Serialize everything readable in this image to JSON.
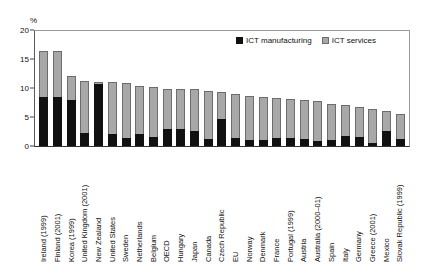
{
  "chart_data": {
    "type": "bar",
    "stacked": true,
    "title": "",
    "xlabel": "",
    "ylabel": "%",
    "ylim": [
      0,
      20
    ],
    "yticks": [
      0,
      5,
      10,
      15,
      20
    ],
    "grid": false,
    "legend_position": "top-right",
    "categories": [
      "Ireland (1999)",
      "Finland (2001)",
      "Korea (1999)",
      "United Kingdom (2001)",
      "New Zealand",
      "United States",
      "Sweden",
      "Netherlands",
      "Belgium",
      "OECD",
      "Hungary",
      "Japan",
      "Canada",
      "Czech Republic",
      "EU",
      "Norway",
      "Denmark",
      "France",
      "Portugal (1999)",
      "Austria",
      "Australia (2000–01)",
      "Spain",
      "Italy",
      "Germany",
      "Greece (2001)",
      "Mexico",
      "Slovak Republic (1999)"
    ],
    "series": [
      {
        "name": "ICT manufacturing",
        "color": "#111111",
        "values": [
          8.4,
          8.4,
          8.0,
          2.2,
          10.7,
          2.1,
          1.4,
          2.0,
          1.6,
          2.9,
          3.0,
          2.6,
          1.2,
          4.6,
          1.4,
          1.0,
          1.1,
          1.3,
          1.4,
          1.2,
          0.9,
          1.0,
          1.7,
          1.6,
          0.5,
          2.6,
          1.2
        ]
      },
      {
        "name": "ICT services",
        "color": "#a8a8a8",
        "values": [
          8.0,
          8.0,
          4.0,
          9.0,
          0.4,
          8.9,
          9.4,
          8.3,
          8.6,
          7.0,
          6.8,
          7.2,
          8.3,
          4.7,
          7.5,
          7.6,
          7.4,
          7.0,
          6.7,
          6.7,
          6.8,
          6.3,
          5.3,
          5.2,
          5.9,
          3.4,
          4.4
        ]
      }
    ]
  },
  "legend": {
    "items": [
      {
        "label": "ICT manufacturing"
      },
      {
        "label": "ICT services"
      }
    ]
  },
  "axis": {
    "unit": "%"
  }
}
